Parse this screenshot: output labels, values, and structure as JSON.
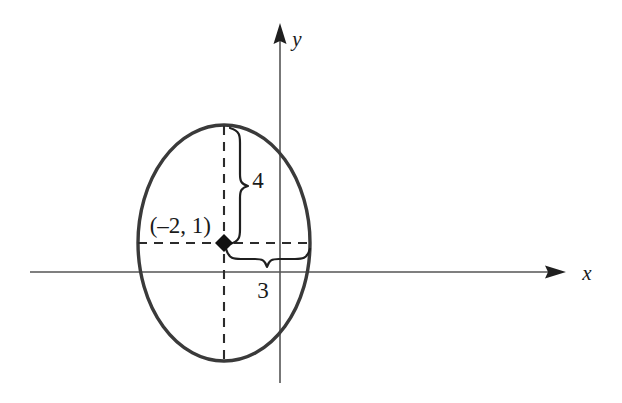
{
  "figure": {
    "background_color": "#ffffff",
    "curve_color": "#3a3a3a",
    "axis_color": "#555555",
    "text_color": "#1a1a1a"
  },
  "axes": {
    "x_label": "x",
    "y_label": "y",
    "x_axis": {
      "y": 272,
      "x_start": 30,
      "x_end": 558
    },
    "y_axis": {
      "x": 280,
      "y_start": 28,
      "y_end": 383
    }
  },
  "ellipse": {
    "center_x": 224,
    "center_y": 243,
    "radius_x": 86,
    "radius_y": 118,
    "stroke_width": 3.4
  },
  "center_point": {
    "label": "(–2, 1)",
    "x": 224,
    "y": 243,
    "marker": "filled-diamond"
  },
  "dimensions": {
    "vertical": {
      "label": "4",
      "from_y": 127,
      "to_y": 243,
      "brace_x": 232,
      "label_x": 258,
      "label_y": 187
    },
    "horizontal": {
      "label": "3",
      "from_x": 224,
      "to_x": 310,
      "brace_y": 253,
      "label_x": 263,
      "label_y": 298
    }
  },
  "dashed_lines": {
    "horizontal": {
      "y": 243,
      "x_start": 138,
      "x_end": 311
    },
    "vertical": {
      "x": 224,
      "y_start": 126,
      "y_end": 362
    }
  }
}
